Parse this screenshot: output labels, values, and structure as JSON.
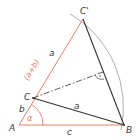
{
  "diagram": {
    "colors": {
      "construction": "#e8806a",
      "main": "#333333",
      "arc": "#9a9a9a"
    },
    "points": {
      "A": "A",
      "B": "B",
      "C": "C",
      "C_prime": "C'"
    },
    "side_labels": {
      "a_upper": "a",
      "a_lower": "a",
      "b": "b",
      "c": "c",
      "sum": "(a+b)"
    },
    "angle_label": "α"
  }
}
